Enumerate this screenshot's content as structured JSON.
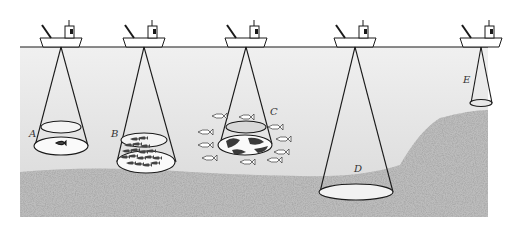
{
  "diagram": {
    "colors": {
      "background": "#ffffff",
      "water": "#e4e4e4",
      "seabed": "#b8b8b8",
      "line": "#1a1a1a",
      "footprint": "#f7f7f7"
    },
    "vessels": [
      {
        "id": "A",
        "x": 61
      },
      {
        "id": "B",
        "x": 144
      },
      {
        "id": "C",
        "x": 246
      },
      {
        "id": "D",
        "x": 355
      },
      {
        "id": "E",
        "x": 481
      }
    ],
    "beams": [
      {
        "label": "A",
        "description": "single fish in beam, mid-water"
      },
      {
        "label": "B",
        "description": "dense school of small fish inside beam"
      },
      {
        "label": "C",
        "description": "school of larger fish surrounding and inside beam"
      },
      {
        "label": "D",
        "description": "wide beam reaching the seabed in deep water"
      },
      {
        "label": "E",
        "description": "narrow beam reaching raised seabed in shallow water"
      }
    ]
  }
}
